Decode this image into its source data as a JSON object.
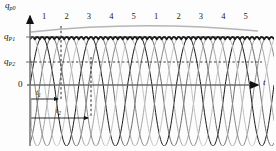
{
  "figure": {
    "name": "pump-flow-pulsation-diagram",
    "background": "#fdfdfd"
  },
  "axes": {
    "y_axis_label": "q",
    "y_axis_label_sub": "p0",
    "x_axis_label": "t",
    "origin_label": "0",
    "y_ticks": [
      {
        "label": "q",
        "sub": "P",
        "sub2": "1",
        "value": 0.93,
        "y_px": 37
      },
      {
        "label": "q",
        "sub": "P",
        "sub2": "2",
        "value": 0.7,
        "y_px": 62
      }
    ],
    "axis_color": "#6d6d6d",
    "arrow_color": "#111111"
  },
  "cycle_numbers": {
    "group1": [
      "1",
      "2",
      "3",
      "4",
      "5"
    ],
    "group2": [
      "1",
      "2",
      "3",
      "4",
      "5"
    ]
  },
  "annotations": [
    {
      "name": "t1",
      "label": "t",
      "sub": "1",
      "x_px": 36,
      "y_px": 90
    },
    {
      "name": "t2",
      "label": "t",
      "sub": "2",
      "x_px": 55,
      "y_px": 108
    }
  ],
  "colors": {
    "envelope_dark": "#1a1a1a",
    "curve_mid": "#6e6e6e",
    "curve_light": "#a8a8a8",
    "curve_lighter": "#c4c4c4",
    "dashed": "#2b2b2b",
    "axis": "#6d6d6d"
  },
  "chart_data": {
    "type": "line",
    "title": "",
    "xlabel": "t",
    "ylabel": "q_p0",
    "xlim": [
      0,
      10
    ],
    "ylim": [
      -1.15,
      1.1
    ],
    "grid": false,
    "legend": null,
    "reference_lines": [
      {
        "name": "q_P1",
        "y": 0.93,
        "style": "dashed"
      },
      {
        "name": "q_P2",
        "y": 0.7,
        "style": "dashed"
      }
    ],
    "cycle_tick_values": [
      1,
      2,
      3,
      4,
      5,
      1,
      2,
      3,
      4,
      5
    ],
    "series": [
      {
        "name": "piston-1",
        "shade": "#1a1a1a",
        "phase": 0.0,
        "amplitude": 1.0,
        "period": 2.0
      },
      {
        "name": "piston-2",
        "shade": "#6e6e6e",
        "phase": 0.4,
        "amplitude": 1.0,
        "period": 2.0
      },
      {
        "name": "piston-3",
        "shade": "#a8a8a8",
        "phase": 0.8,
        "amplitude": 1.0,
        "period": 2.0
      },
      {
        "name": "piston-4",
        "shade": "#8a8a8a",
        "phase": 1.2,
        "amplitude": 1.0,
        "period": 2.0
      },
      {
        "name": "piston-5",
        "shade": "#c4c4c4",
        "phase": 1.6,
        "amplitude": 1.0,
        "period": 2.0
      }
    ],
    "envelope": {
      "name": "total-discharge-envelope",
      "shade": "#1a1a1a",
      "peak": 0.93,
      "trough": 0.7
    }
  }
}
